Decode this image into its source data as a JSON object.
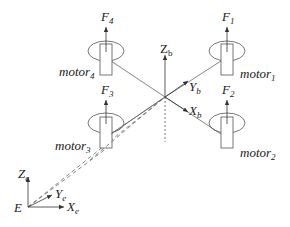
{
  "diagram": {
    "type": "quadrotor-coordinate-frames",
    "stroke_color": "#555555",
    "motors": [
      {
        "id": "motor1",
        "label": "motor",
        "sub": "1",
        "force": "F",
        "force_sub": "1"
      },
      {
        "id": "motor2",
        "label": "motor",
        "sub": "2",
        "force": "F",
        "force_sub": "2"
      },
      {
        "id": "motor3",
        "label": "motor",
        "sub": "3",
        "force": "F",
        "force_sub": "3"
      },
      {
        "id": "motor4",
        "label": "motor",
        "sub": "4",
        "force": "F",
        "force_sub": "4"
      }
    ],
    "body_frame": {
      "z": {
        "label": "Z",
        "sub": "b"
      },
      "y": {
        "label": "Y",
        "sub": "b"
      },
      "x": {
        "label": "X",
        "sub": "b"
      }
    },
    "earth_frame": {
      "origin": "E",
      "z": {
        "label": "Z",
        "sub": "e"
      },
      "y": {
        "label": "Y",
        "sub": "e"
      },
      "x": {
        "label": "X",
        "sub": "e"
      }
    }
  }
}
